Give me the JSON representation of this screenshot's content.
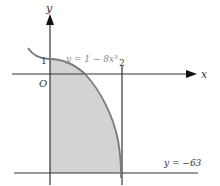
{
  "diagram": {
    "type": "function-graph",
    "axes": {
      "x_label": "x",
      "y_label": "y",
      "origin_label": "O"
    },
    "ticks": {
      "y_one": "1",
      "x_two": "2"
    },
    "curve": {
      "equation_label": "y = 1 − 8x³",
      "color": "#7a7a7a"
    },
    "horizontal_line": {
      "label": "y = −63",
      "value": -63
    },
    "vertical_line": {
      "value": 2
    },
    "shaded_region": {
      "description": "Region bounded by curve, y-axis, x = 2 and y = −63",
      "color": "#d3d3d3"
    },
    "colors": {
      "axis": "#333333",
      "shade": "#d3d3d3",
      "curve": "#7a7a7a",
      "background": "#ffffff"
    }
  }
}
